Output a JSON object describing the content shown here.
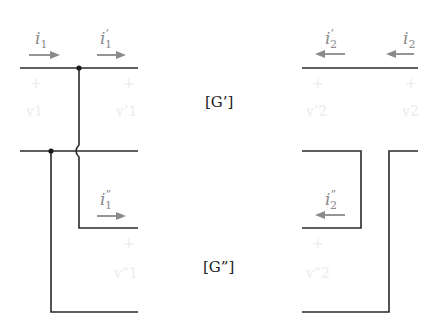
{
  "diagram": {
    "blocks": {
      "g_prime": "[G’]",
      "g_double_prime": "[G”]"
    },
    "currents": {
      "i1": {
        "base": "i",
        "sub": "1",
        "prime": "",
        "direction": "right"
      },
      "i1p": {
        "base": "i",
        "sub": "1",
        "prime": "’",
        "direction": "right"
      },
      "i1pp": {
        "base": "i",
        "sub": "1",
        "prime": "”",
        "direction": "right"
      },
      "i2": {
        "base": "i",
        "sub": "2",
        "prime": "",
        "direction": "left"
      },
      "i2p": {
        "base": "i",
        "sub": "2",
        "prime": "’",
        "direction": "left"
      },
      "i2pp": {
        "base": "i",
        "sub": "2",
        "prime": "”",
        "direction": "left"
      }
    },
    "voltages": {
      "plus": "+",
      "v1": "v1",
      "v1p": "v’1",
      "v1pp": "v”1",
      "v2": "v2",
      "v2p": "v’2",
      "v2pp": "v”2"
    },
    "colors": {
      "wire": "#2a2a2a",
      "arrow": "#8a8a8a",
      "faint_label": "#ececec"
    }
  }
}
